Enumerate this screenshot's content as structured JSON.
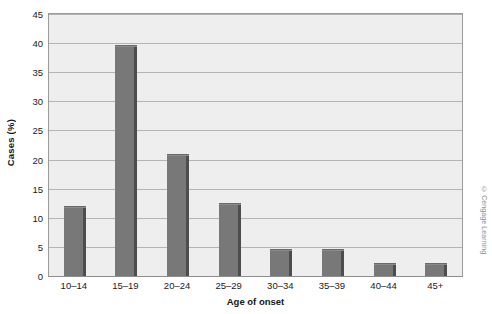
{
  "chart_data": {
    "type": "bar",
    "title": "",
    "xlabel": "Age of onset",
    "ylabel": "Cases (%)",
    "categories": [
      "10–14",
      "15–19",
      "20–24",
      "25–29",
      "30–34",
      "35–39",
      "40–44",
      "45+"
    ],
    "values": [
      12,
      39.7,
      21,
      12.5,
      4.7,
      4.7,
      2.3,
      2.3
    ],
    "ylim": [
      0,
      45
    ],
    "yticks": [
      0,
      5,
      10,
      15,
      20,
      25,
      30,
      35,
      40,
      45
    ],
    "ytick_labels": [
      "0",
      "5",
      "10",
      "15",
      "20",
      "25",
      "30",
      "35",
      "40",
      "45"
    ],
    "grid": true,
    "legend": null,
    "bar_color": "#787878",
    "bar_shadow_color": "#4d4d4d",
    "plot_background": "#eeeeee",
    "gridline_color": "#b4b4b4",
    "frame_color": "#9a9a9a"
  },
  "credit": {
    "text": "© Cengage Learning"
  }
}
